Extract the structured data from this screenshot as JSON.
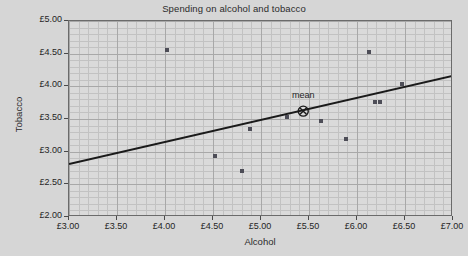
{
  "chart_data": {
    "type": "scatter",
    "title": "Spending on alcohol and tobacco",
    "xlabel": "Alcohol",
    "ylabel": "Tobacco",
    "xlim": [
      3.0,
      7.0
    ],
    "ylim": [
      2.0,
      5.0
    ],
    "xticks": [
      3.0,
      3.5,
      4.0,
      4.5,
      5.0,
      5.5,
      6.0,
      6.5,
      7.0
    ],
    "xticklabels": [
      "£3.00",
      "£3.50",
      "£4.00",
      "£4.50",
      "£5.00",
      "£5.50",
      "£6.00",
      "£6.50",
      "£7.00"
    ],
    "yticks": [
      2.0,
      2.5,
      3.0,
      3.5,
      4.0,
      4.5,
      5.0
    ],
    "yticklabels": [
      "£2.00",
      "£2.50",
      "£3.00",
      "£3.50",
      "£4.00",
      "£4.50",
      "£5.00"
    ],
    "grid": true,
    "grid_minor": true,
    "legend": "none",
    "currency_symbol": "£",
    "points": [
      {
        "x": 4.02,
        "y": 4.56
      },
      {
        "x": 4.52,
        "y": 2.93
      },
      {
        "x": 4.8,
        "y": 2.71
      },
      {
        "x": 4.89,
        "y": 3.34
      },
      {
        "x": 5.27,
        "y": 3.53
      },
      {
        "x": 5.63,
        "y": 3.47
      },
      {
        "x": 5.89,
        "y": 3.2
      },
      {
        "x": 6.13,
        "y": 4.52
      },
      {
        "x": 6.19,
        "y": 3.76
      },
      {
        "x": 6.24,
        "y": 3.76
      },
      {
        "x": 6.47,
        "y": 4.03
      }
    ],
    "mean_point": {
      "x": 5.44,
      "y": 3.62,
      "label": "mean"
    },
    "fit_line": {
      "x": [
        3.0,
        7.0
      ],
      "y": [
        2.81,
        4.16
      ]
    },
    "colors": {
      "background": "#d6d6d6",
      "plot_background": "#dadada",
      "grid_minor": "#c2c2c2",
      "grid_major": "#a8a8a8",
      "axis": "#6b6b6b",
      "marker": "#4d4d57",
      "line": "#1a1a1a",
      "text": "#1f1f1f"
    }
  }
}
